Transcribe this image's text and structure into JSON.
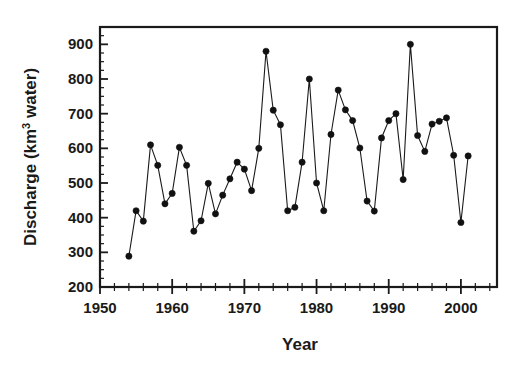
{
  "figure": {
    "background_color": "#ffffff",
    "foreground_color": "#1a1a1a",
    "marker_color": "#111111"
  },
  "chart_data": {
    "type": "line",
    "title": "",
    "subtitle": "",
    "xlabel": "Year",
    "ylabel": "Discharge (km3 water)",
    "ylabel_parts": {
      "prefix": "Discharge (km",
      "superscript": "3",
      "suffix": " water)"
    },
    "xlim": [
      1950,
      2005
    ],
    "ylim": [
      200,
      950
    ],
    "x_major_ticks": [
      1950,
      1960,
      1970,
      1980,
      1990,
      2000
    ],
    "x_major_tick_labels": [
      "1950",
      "1960",
      "1970",
      "1980",
      "1990",
      "2000"
    ],
    "x_minor_tick_step": 2,
    "y_major_ticks": [
      200,
      300,
      400,
      500,
      600,
      700,
      800,
      900
    ],
    "y_major_tick_labels": [
      "200",
      "300",
      "400",
      "500",
      "600",
      "700",
      "800",
      "900"
    ],
    "y_minor_tick_step": 25,
    "grid": false,
    "legend": null,
    "legend_position": "none",
    "marker": "filled-circle",
    "x": [
      1954,
      1955,
      1956,
      1957,
      1958,
      1959,
      1960,
      1961,
      1962,
      1963,
      1964,
      1965,
      1966,
      1967,
      1968,
      1969,
      1970,
      1971,
      1972,
      1973,
      1974,
      1975,
      1976,
      1977,
      1978,
      1979,
      1980,
      1981,
      1982,
      1983,
      1984,
      1985,
      1986,
      1987,
      1988,
      1989,
      1990,
      1991,
      1992,
      1993,
      1994,
      1995,
      1996,
      1997,
      1998,
      1999,
      2000,
      2001
    ],
    "values": [
      289,
      420,
      390,
      610,
      551,
      440,
      470,
      603,
      551,
      361,
      391,
      499,
      411,
      465,
      512,
      560,
      540,
      478,
      600,
      880,
      710,
      668,
      420,
      430,
      560,
      800,
      500,
      420,
      640,
      768,
      711,
      680,
      601,
      448,
      419,
      630,
      680,
      700,
      510,
      900,
      637,
      591,
      670,
      678,
      688,
      580,
      386,
      578
    ],
    "units": "km3 water",
    "series": [
      {
        "name": "Discharge",
        "values": [
          289,
          420,
          390,
          610,
          551,
          440,
          470,
          603,
          551,
          361,
          391,
          499,
          411,
          465,
          512,
          560,
          540,
          478,
          600,
          880,
          710,
          668,
          420,
          430,
          560,
          800,
          500,
          420,
          640,
          768,
          711,
          680,
          601,
          448,
          419,
          630,
          680,
          700,
          510,
          900,
          637,
          591,
          670,
          678,
          688,
          580,
          386,
          578
        ]
      }
    ]
  }
}
